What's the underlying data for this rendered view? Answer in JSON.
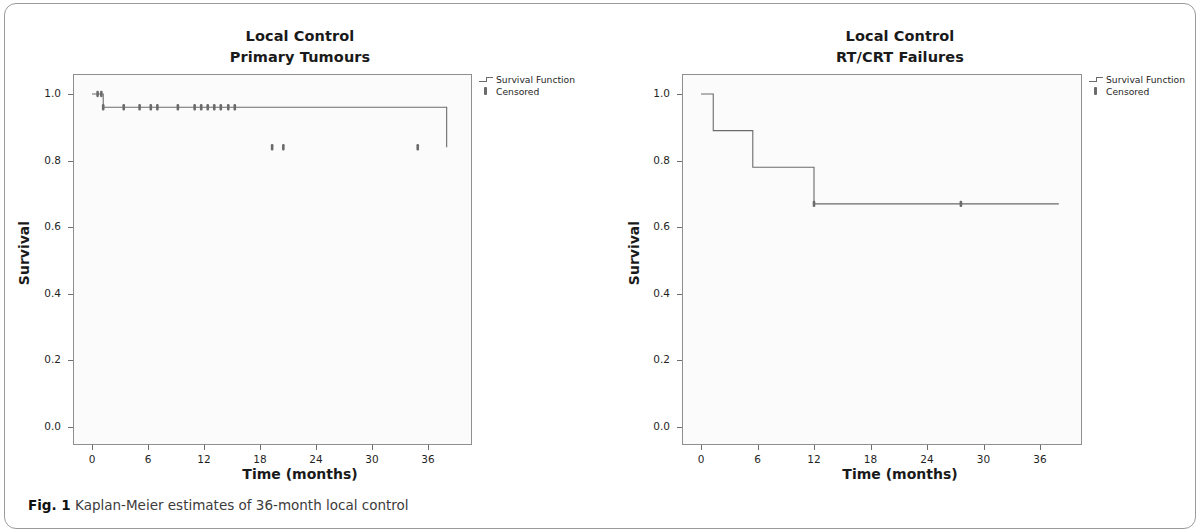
{
  "figure": {
    "caption_label": "Fig. 1",
    "caption_text": "Kaplan-Meier estimates of 36-month local control"
  },
  "legend": {
    "survival_function": "Survival Function",
    "censored": "Censored"
  },
  "axes": {
    "xlabel": "Time (months)",
    "ylabel": "Survival",
    "xticks": [
      "0",
      "6",
      "12",
      "18",
      "24",
      "30",
      "36"
    ],
    "yticks": [
      "1.0",
      "0.8",
      "0.6",
      "0.4",
      "0.2",
      "0.0"
    ]
  },
  "colors": {
    "line": "#6b6b6b",
    "frame": "#8f8f8f",
    "plot_background": "#fbfbfb",
    "text": "#1a1a1a",
    "card_border": "#9a9a9a"
  },
  "chart_data": [
    {
      "type": "line",
      "title": "Local Control",
      "subtitle": "Primary Tumours",
      "xlabel": "Time (months)",
      "ylabel": "Survival",
      "xlim": [
        -1.8,
        38.5
      ],
      "ylim": [
        0.0,
        1.0
      ],
      "xticks": [
        0,
        6,
        12,
        18,
        24,
        30,
        36
      ],
      "yticks": [
        0.0,
        0.2,
        0.4,
        0.6,
        0.8,
        1.0
      ],
      "grid": false,
      "legend_position": "outside-top-right",
      "series": [
        {
          "name": "Survival Function",
          "step": "post",
          "x": [
            0,
            1.2,
            17.0,
            38.0
          ],
          "y": [
            1.0,
            0.96,
            0.96,
            0.84
          ],
          "steps": [
            {
              "time": 0,
              "survival": 1.0
            },
            {
              "time": 1.2,
              "survival": 0.96
            },
            {
              "time": 17.0,
              "survival": 0.84
            }
          ]
        },
        {
          "name": "Censored",
          "marker": "tick",
          "x": [
            0.6,
            1.0,
            1.2,
            3.4,
            5.1,
            6.3,
            7.0,
            9.2,
            11.0,
            11.7,
            12.4,
            13.1,
            13.8,
            14.6,
            15.3,
            19.3,
            20.5,
            34.9
          ],
          "y": [
            1.0,
            1.0,
            0.96,
            0.96,
            0.96,
            0.96,
            0.96,
            0.96,
            0.96,
            0.96,
            0.96,
            0.96,
            0.96,
            0.96,
            0.96,
            0.84,
            0.84,
            0.84
          ]
        }
      ]
    },
    {
      "type": "line",
      "title": "Local Control",
      "subtitle": "RT/CRT Failures",
      "xlabel": "Time (months)",
      "ylabel": "Survival",
      "xlim": [
        -1.8,
        38.5
      ],
      "ylim": [
        0.0,
        1.0
      ],
      "xticks": [
        0,
        6,
        12,
        18,
        24,
        30,
        36
      ],
      "yticks": [
        0.0,
        0.2,
        0.4,
        0.6,
        0.8,
        1.0
      ],
      "grid": false,
      "legend_position": "outside-top-right",
      "series": [
        {
          "name": "Survival Function",
          "step": "post",
          "x": [
            0,
            1.3,
            5.5,
            12.0,
            38.0
          ],
          "y": [
            1.0,
            0.89,
            0.78,
            0.67,
            0.67
          ],
          "steps": [
            {
              "time": 0,
              "survival": 1.0
            },
            {
              "time": 1.3,
              "survival": 0.89
            },
            {
              "time": 5.5,
              "survival": 0.78
            },
            {
              "time": 12.0,
              "survival": 0.67
            }
          ]
        },
        {
          "name": "Censored",
          "marker": "tick",
          "x": [
            12.0,
            27.6
          ],
          "y": [
            0.67,
            0.67
          ]
        }
      ]
    }
  ]
}
